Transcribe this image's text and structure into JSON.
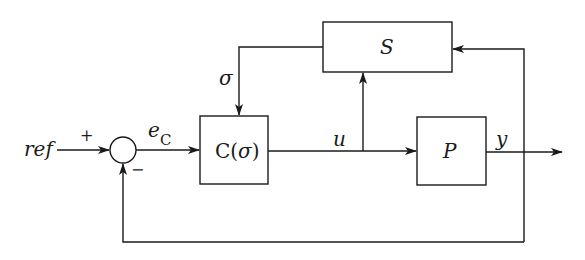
{
  "diagram": {
    "type": "feedback-control-block-diagram",
    "blocks": [
      {
        "id": "S",
        "label": "S"
      },
      {
        "id": "C",
        "label_main": "C(",
        "label_sigma": "σ",
        "label_close": ")"
      },
      {
        "id": "P",
        "label": "P"
      }
    ],
    "summing_junction": {
      "plus_sign": "+",
      "minus_sign": "−"
    },
    "signals": {
      "ref": "ref",
      "error_base": "e",
      "error_sub": "C",
      "sigma": "σ",
      "u": "u",
      "y": "y"
    },
    "colors": {
      "stroke": "#1a1a1a",
      "background": "#ffffff"
    }
  }
}
